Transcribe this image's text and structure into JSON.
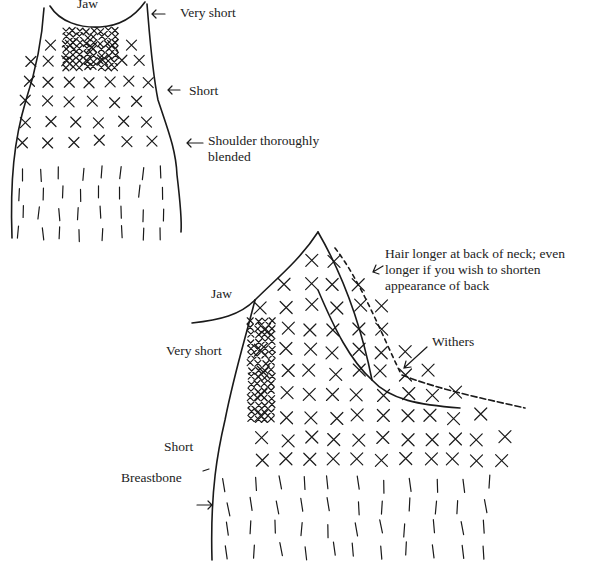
{
  "figure": {
    "front_view": {
      "labels": {
        "jaw": "Jaw",
        "very_short": "Very short",
        "short": "Short",
        "shoulder_line1": "Shoulder thoroughly",
        "shoulder_line2": "blended"
      }
    },
    "side_view": {
      "labels": {
        "hair_line1": "Hair longer at back of neck; even",
        "hair_line2": "longer if you wish to shorten",
        "hair_line3": "appearance of back",
        "jaw": "Jaw",
        "withers": "Withers",
        "very_short": "Very short",
        "short": "Short",
        "breastbone": "Breastbone"
      }
    },
    "arrow_glyph": "←",
    "ink_color": "#1a1a1a",
    "background": "#ffffff"
  }
}
